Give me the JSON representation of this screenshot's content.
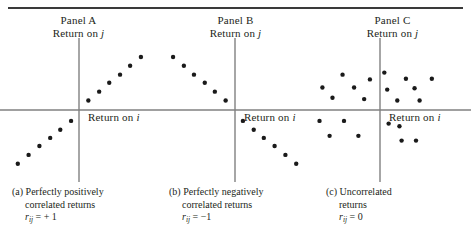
{
  "figure": {
    "rule_color": "#3a3a3a",
    "axis_color": "#808080",
    "point_color": "#1a1a1a"
  },
  "panels": [
    {
      "key": "panel-a",
      "title": "Panel A",
      "y_axis_label_prefix": "Return on ",
      "y_axis_label_var": "j",
      "x_axis_label_prefix": "Return on ",
      "x_axis_label_var": "i",
      "caption_line1": "(a) Perfectly positively",
      "caption_line2": "correlated returns",
      "caption_sym": "r",
      "caption_sub": "ij",
      "caption_value": " = + 1"
    },
    {
      "key": "panel-b",
      "title": "Panel B",
      "y_axis_label_prefix": "Return on ",
      "y_axis_label_var": "j",
      "x_axis_label_prefix": "Return on ",
      "x_axis_label_var": "i",
      "caption_line1": "(b) Perfectly negatively",
      "caption_line2": "correlated returns",
      "caption_sym": "r",
      "caption_sub": "ij",
      "caption_value": " = −1"
    },
    {
      "key": "panel-c",
      "title": "Panel C",
      "y_axis_label_prefix": "Return on ",
      "y_axis_label_var": "j",
      "x_axis_label_prefix": "Return on ",
      "x_axis_label_var": "i",
      "caption_line1": "(c) Uncorrelated",
      "caption_line2": "returns",
      "caption_sym": "r",
      "caption_sub": "ij",
      "caption_value": " = 0"
    }
  ],
  "chart_data": [
    {
      "type": "scatter",
      "title": "Panel A",
      "xlabel": "Return on i",
      "ylabel": "Return on j",
      "annotation": "Perfectly positively correlated returns, r_ij = +1",
      "correlation": 1,
      "grid": false,
      "xlim": [
        -1,
        1
      ],
      "ylim": [
        -1,
        1
      ],
      "origin_px": [
        79,
        74
      ],
      "points": [
        [
          -0.85,
          -0.79
        ],
        [
          -0.7,
          -0.66
        ],
        [
          -0.55,
          -0.53
        ],
        [
          -0.4,
          -0.41
        ],
        [
          -0.26,
          -0.29
        ],
        [
          -0.11,
          -0.16
        ],
        [
          0.13,
          0.14
        ],
        [
          0.28,
          0.27
        ],
        [
          0.42,
          0.4
        ],
        [
          0.57,
          0.52
        ],
        [
          0.71,
          0.65
        ],
        [
          0.86,
          0.78
        ]
      ]
    },
    {
      "type": "scatter",
      "title": "Panel B",
      "xlabel": "Return on i",
      "ylabel": "Return on j",
      "annotation": "Perfectly negatively correlated returns, r_ij = -1",
      "correlation": -1,
      "grid": false,
      "xlim": [
        -1,
        1
      ],
      "ylim": [
        -1,
        1
      ],
      "origin_px": [
        78,
        74
      ],
      "points": [
        [
          -0.86,
          0.78
        ],
        [
          -0.71,
          0.65
        ],
        [
          -0.57,
          0.52
        ],
        [
          -0.42,
          0.4
        ],
        [
          -0.28,
          0.27
        ],
        [
          -0.13,
          0.14
        ],
        [
          0.11,
          -0.16
        ],
        [
          0.26,
          -0.29
        ],
        [
          0.4,
          -0.41
        ],
        [
          0.55,
          -0.53
        ],
        [
          0.7,
          -0.66
        ],
        [
          0.85,
          -0.79
        ]
      ]
    },
    {
      "type": "scatter",
      "title": "Panel C",
      "xlabel": "Return on i",
      "ylabel": "Return on j",
      "annotation": "Uncorrelated returns, r_ij = 0",
      "correlation": 0,
      "grid": false,
      "xlim": [
        -1,
        1
      ],
      "ylim": [
        -1,
        1
      ],
      "origin_px": [
        66,
        74
      ],
      "points": [
        [
          -0.52,
          0.52
        ],
        [
          -0.8,
          0.33
        ],
        [
          -0.36,
          0.33
        ],
        [
          -0.14,
          0.45
        ],
        [
          -0.66,
          0.18
        ],
        [
          -0.22,
          0.16
        ],
        [
          0.06,
          0.55
        ],
        [
          0.36,
          0.46
        ],
        [
          0.72,
          0.46
        ],
        [
          0.1,
          0.3
        ],
        [
          0.48,
          0.32
        ],
        [
          0.24,
          0.14
        ],
        [
          0.55,
          0.14
        ],
        [
          -0.84,
          -0.16
        ],
        [
          -0.5,
          -0.16
        ],
        [
          -0.7,
          -0.38
        ],
        [
          -0.3,
          -0.38
        ],
        [
          0.12,
          -0.2
        ],
        [
          0.27,
          -0.24
        ],
        [
          0.3,
          -0.45
        ],
        [
          0.5,
          -0.45
        ]
      ]
    }
  ]
}
